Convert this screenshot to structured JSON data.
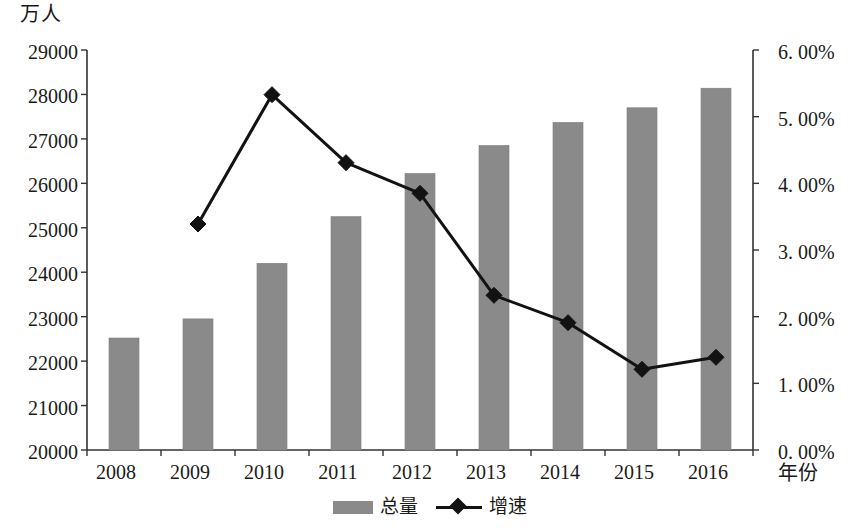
{
  "chart_data": {
    "type": "bar",
    "title": "",
    "unit_label": "万人",
    "xlabel": "年份",
    "categories": [
      "2008",
      "2009",
      "2010",
      "2011",
      "2012",
      "2013",
      "2014",
      "2015",
      "2016"
    ],
    "series": [
      {
        "name": "总量",
        "type": "bar",
        "axis": "left",
        "color": "#8a8a8a",
        "values": [
          22520,
          22950,
          24200,
          25250,
          26220,
          26850,
          27370,
          27700,
          28140
        ]
      },
      {
        "name": "增速",
        "type": "line",
        "axis": "right",
        "color": "#121212",
        "marker": "diamond",
        "values": [
          null,
          3.39,
          5.33,
          4.31,
          3.85,
          2.32,
          1.91,
          1.21,
          1.39
        ]
      }
    ],
    "yaxis_left": {
      "label": "万人",
      "min": 20000,
      "max": 29000,
      "step": 1000,
      "ticks": [
        "20000",
        "21000",
        "22000",
        "23000",
        "24000",
        "25000",
        "26000",
        "27000",
        "28000",
        "29000"
      ]
    },
    "yaxis_right": {
      "label": "",
      "min": 0,
      "max": 6,
      "step": 1,
      "ticks": [
        "0. 00%",
        "1. 00%",
        "2. 00%",
        "3. 00%",
        "4. 00%",
        "5. 00%",
        "6. 00%"
      ]
    },
    "xaxis": {
      "label": "年份",
      "ticks": [
        "2008",
        "2009",
        "2010",
        "2011",
        "2012",
        "2013",
        "2014",
        "2015",
        "2016"
      ]
    },
    "legend": {
      "position": "bottom",
      "entries": [
        {
          "label": "总量",
          "marker": "bar-swatch",
          "color": "#8a8a8a"
        },
        {
          "label": "增速",
          "marker": "line-diamond",
          "color": "#121212"
        }
      ]
    },
    "grid": false
  }
}
